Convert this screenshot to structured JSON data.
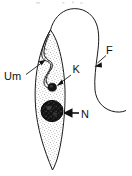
{
  "figure": {
    "organism": "trypanosome",
    "style": "line drawing with stipple shading",
    "background_color": "#ffffff",
    "ink_color": "#1a1a1a",
    "labels": [
      {
        "id": "um",
        "text": "Um",
        "meaning": "undulating membrane",
        "x": 4,
        "y": 78,
        "arrow_from": [
          26,
          74
        ],
        "arrow_to": [
          45,
          60
        ]
      },
      {
        "id": "k",
        "text": "K",
        "meaning": "kinetoplast",
        "x": 73,
        "y": 73,
        "arrow_from": [
          72,
          74
        ],
        "arrow_to": [
          57,
          86
        ]
      },
      {
        "id": "n",
        "text": "N",
        "meaning": "nucleus",
        "x": 81,
        "y": 118,
        "arrow_from": [
          79,
          113
        ],
        "arrow_to": [
          63,
          113
        ]
      },
      {
        "id": "f",
        "text": "F",
        "meaning": "flagellum",
        "x": 107,
        "y": 54,
        "arrow_from": [
          106,
          55
        ],
        "arrow_to": [
          94,
          66
        ]
      }
    ],
    "structures": [
      {
        "id": "cell-body",
        "name": "cell body",
        "fill": "stippled",
        "shape": "elongated tapering spindle"
      },
      {
        "id": "nucleus",
        "name": "nucleus",
        "fill": "dark mottled",
        "cx": 52,
        "cy": 111,
        "rx": 11,
        "ry": 11
      },
      {
        "id": "kinetoplast",
        "name": "kinetoplast",
        "fill": "dark",
        "cx": 52,
        "cy": 87,
        "rx": 4,
        "ry": 4
      },
      {
        "id": "undulating-membrane",
        "name": "undulating membrane",
        "fill": "none",
        "shape": "wavy line along left margin"
      },
      {
        "id": "flagellum",
        "name": "flagellum",
        "fill": "none",
        "shape": "long free filament looping over top and descending right"
      }
    ]
  }
}
